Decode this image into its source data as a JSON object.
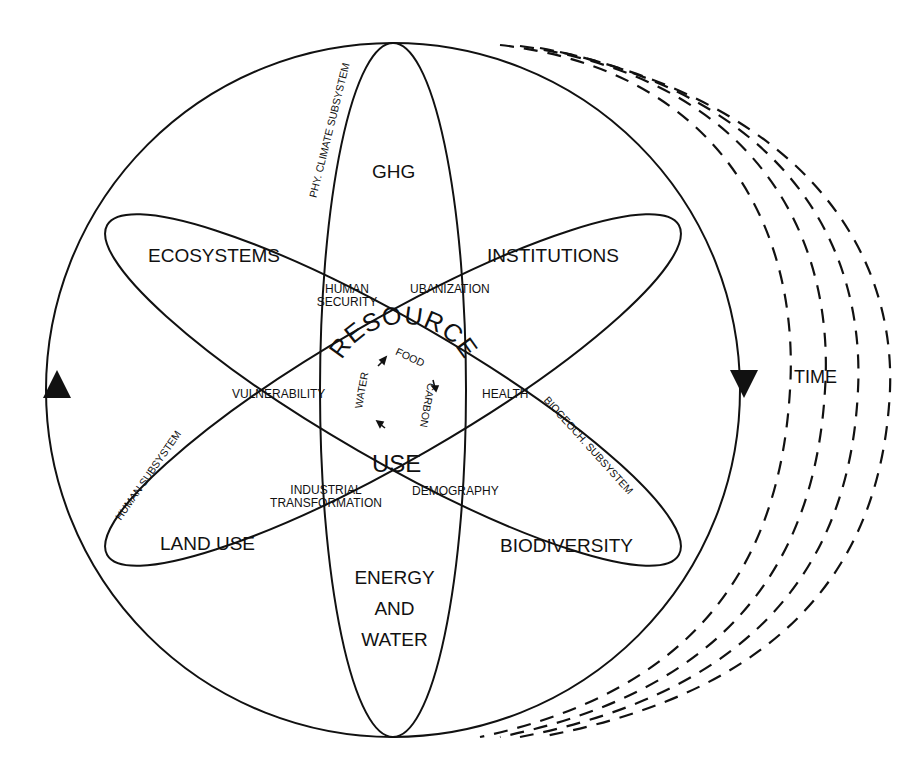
{
  "diagram": {
    "type": "earth-system-interactions",
    "outer_cycle_labels": {
      "time": "TIME"
    },
    "domains": {
      "top": "GHG",
      "upper_left": "ECOSYSTEMS",
      "upper_right": "INSTITUTIONS",
      "lower_left": "LAND USE",
      "lower_right": "BIODIVERSITY",
      "bottom_line1": "ENERGY",
      "bottom_line2": "AND",
      "bottom_line3": "WATER"
    },
    "subsystems": {
      "physical_climate": "PHY. CLIMATE SUBSYSTEM",
      "human": "HUMAN SUBSYSTEM",
      "biogeochemical": "BIOGEOCH. SUBSYSTEM"
    },
    "intersections": {
      "human_security_line1": "HUMAN",
      "human_security_line2": "SECURITY",
      "urbanization": "UBANIZATION",
      "vulnerability": "VULNERABILITY",
      "health": "HEALTH",
      "industrial_transformation_line1": "INDUSTRIAL",
      "industrial_transformation_line2": "TRANSFORMATION",
      "demography": "DEMOGRAPHY"
    },
    "core": {
      "title_top": "RESOURCE",
      "title_bottom": "USE",
      "cycle": [
        "FOOD",
        "CARBON",
        "WATER"
      ]
    },
    "colors": {
      "ink": "#111111",
      "background": "#ffffff"
    }
  }
}
